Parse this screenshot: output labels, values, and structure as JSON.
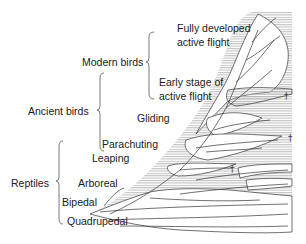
{
  "diagram": {
    "groups": [
      {
        "id": "modern-birds",
        "label": "Modern birds",
        "stages": [
          "Fully developed active flight",
          "Early stage of active flight"
        ]
      },
      {
        "id": "ancient-birds",
        "label": "Ancient birds",
        "stages": [
          "Gliding",
          "Parachuting"
        ]
      },
      {
        "id": "reptiles",
        "label": "Reptiles",
        "stages": [
          "Leaping",
          "Arboreal",
          "Bipedal",
          "Quadrupedal"
        ]
      }
    ],
    "stage_labels": {
      "fully_developed_1": "Fully developed",
      "fully_developed_2": "active flight",
      "early_stage_1": "Early stage of",
      "early_stage_2": "active flight",
      "gliding": "Gliding",
      "parachuting": "Parachuting",
      "leaping": "Leaping",
      "arboreal": "Arboreal",
      "bipedal": "Bipedal",
      "quadrupedal": "Quadrupedal"
    },
    "group_labels": {
      "modern_birds": "Modern birds",
      "ancient_birds": "Ancient birds",
      "reptiles": "Reptiles"
    },
    "extinction_marker": "†",
    "colors": {
      "line": "#333333",
      "hatch": "#bdbdbd",
      "text": "#1a1a1a"
    }
  }
}
